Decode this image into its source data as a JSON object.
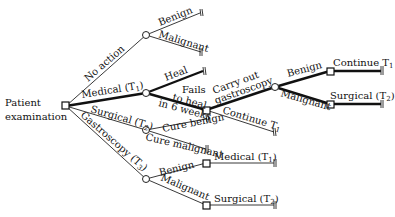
{
  "diagram": {
    "type": "decision-tree",
    "root": {
      "label_line1": "Patient",
      "label_line2": "examination"
    },
    "branches": {
      "no_action": "No action",
      "no_action_benign": "Benign",
      "no_action_malignant": "Malignant",
      "medical": "Medical (T",
      "medical_sub": "1",
      "medical_heal": "Heal",
      "fails_line1": "Fails",
      "fails_line2": "to heal",
      "fails_line3": "in 6 weeks",
      "carry_line1": "Carry out",
      "carry_line2": "gastroscopy",
      "gastro_benign": "Benign",
      "gastro_malignant": "Malignant",
      "continue_t1_top": "Continue T",
      "continue_t1_top_sub": "1",
      "surgical_t2_top": "Surgical (T",
      "surgical_t2_top_sub": "2",
      "continue_t1_mid": "Continue T",
      "continue_t1_mid_sub": "1",
      "surgical": "Surgical (T",
      "surgical_sub": "2",
      "cure_benign": "Cure benign",
      "cure_malignant": "Cure malignant",
      "gastroscopy": "Gastroscopy (T",
      "gastroscopy_sub": "3",
      "g_benign": "Benign",
      "g_malignant": "Malignant",
      "g_medical": "Medical (T",
      "g_medical_sub": "1",
      "g_surgical": "Surgical (T",
      "g_surgical_sub": "2",
      "close_paren": ")"
    },
    "colors": {
      "line": "#222222",
      "background": "#ffffff"
    }
  }
}
